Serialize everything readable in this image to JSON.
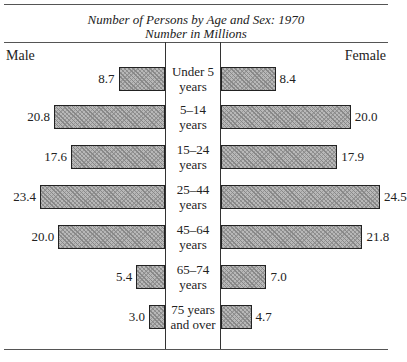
{
  "chart_data": {
    "type": "bar",
    "title": "Number of Persons by Age and Sex: 1970",
    "subtitle": "Number in Millions",
    "left_label": "Male",
    "right_label": "Female",
    "categories": [
      "Under 5 years",
      "5-14 years",
      "15-24 years",
      "25-44 years",
      "45-64 years",
      "65-74 years",
      "75 years and over"
    ],
    "category_lines": [
      [
        "Under 5",
        "years"
      ],
      [
        "5–14",
        "years"
      ],
      [
        "15–24",
        "years"
      ],
      [
        "25–44",
        "years"
      ],
      [
        "45–64",
        "years"
      ],
      [
        "65–74",
        "years"
      ],
      [
        "75 years",
        "and over"
      ]
    ],
    "series": [
      {
        "name": "Male",
        "values": [
          8.7,
          20.8,
          17.6,
          23.4,
          20.0,
          5.4,
          3.0
        ],
        "labels": [
          "8.7",
          "20.8",
          "17.6",
          "23.4",
          "20.0",
          "5.4",
          "3.0"
        ]
      },
      {
        "name": "Female",
        "values": [
          8.4,
          20.0,
          17.9,
          24.5,
          21.8,
          7.0,
          4.7
        ],
        "labels": [
          "8.4",
          "20.0",
          "17.9",
          "24.5",
          "21.8",
          "7.0",
          "4.7"
        ]
      }
    ],
    "layout": "population pyramid (horizontal back-to-back bars)"
  }
}
